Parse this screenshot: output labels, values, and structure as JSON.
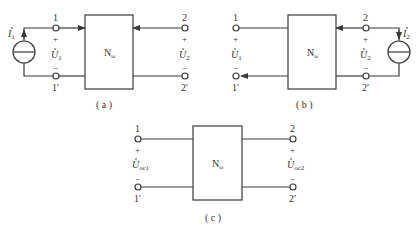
{
  "colors": {
    "stroke": "#3a3a3a",
    "background": "#ffffff"
  },
  "network_label": "N",
  "network_sub": "ω",
  "panels": [
    {
      "id": "a",
      "caption": "( a )",
      "port1": {
        "top": "1",
        "bottom": "1′",
        "plus": "+",
        "minus": "−",
        "voltage": "U",
        "voltage_sub": "1"
      },
      "port2": {
        "top": "2",
        "bottom": "2′",
        "plus": "+",
        "minus": "−",
        "voltage": "U",
        "voltage_sub": "2"
      },
      "source": {
        "side": "left",
        "label": "I",
        "label_sub": "1"
      }
    },
    {
      "id": "b",
      "caption": "( b )",
      "port1": {
        "top": "1",
        "bottom": "1′",
        "plus": "+",
        "minus": "−",
        "voltage": "U",
        "voltage_sub": "1"
      },
      "port2": {
        "top": "2",
        "bottom": "2′",
        "plus": "+",
        "minus": "−",
        "voltage": "U",
        "voltage_sub": "2"
      },
      "source": {
        "side": "right",
        "label": "I",
        "label_sub": "2"
      }
    },
    {
      "id": "c",
      "caption": "( c )",
      "port1": {
        "top": "1",
        "bottom": "1′",
        "plus": "+",
        "minus": "−",
        "voltage": "U",
        "voltage_sub": "oc1"
      },
      "port2": {
        "top": "2",
        "bottom": "2′",
        "plus": "+",
        "minus": "−",
        "voltage": "U",
        "voltage_sub": "oc2"
      },
      "source": null
    }
  ]
}
